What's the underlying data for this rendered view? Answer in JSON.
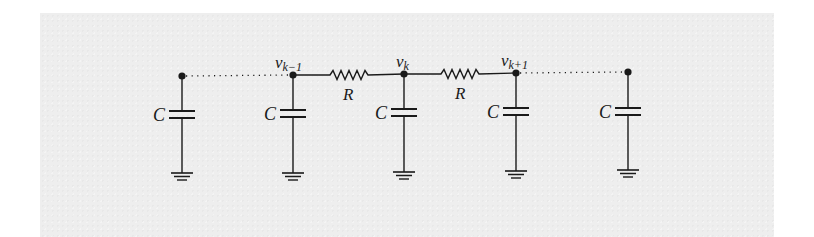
{
  "diagram": {
    "type": "RC ladder (discretized transmission line)",
    "colors": {
      "ink": "#1a1a1a",
      "paper": "#eeeeee",
      "background": "#ffffff"
    },
    "nodes": [
      {
        "id": "left-end",
        "label": "",
        "x": 182,
        "y": 76
      },
      {
        "id": "v_k_minus_1",
        "label_main": "v",
        "label_sub": "k−1",
        "x": 293,
        "y": 75
      },
      {
        "id": "v_k",
        "label_main": "v",
        "label_sub": "k",
        "x": 404,
        "y": 74
      },
      {
        "id": "v_k_plus_1",
        "label_main": "v",
        "label_sub": "k+1",
        "x": 516,
        "y": 73
      },
      {
        "id": "right-end",
        "label": "",
        "x": 628,
        "y": 72
      }
    ],
    "resistors": [
      {
        "label": "R",
        "from": "v_k_minus_1",
        "to": "v_k"
      },
      {
        "label": "R",
        "from": "v_k",
        "to": "v_k_plus_1"
      }
    ],
    "capacitors": [
      {
        "label": "C",
        "node": "left-end"
      },
      {
        "label": "C",
        "node": "v_k_minus_1"
      },
      {
        "label": "C",
        "node": "v_k"
      },
      {
        "label": "C",
        "node": "v_k_plus_1"
      },
      {
        "label": "C",
        "node": "right-end"
      }
    ],
    "dotted_links": [
      {
        "from": "left-end",
        "to": "v_k_minus_1"
      },
      {
        "from": "v_k_plus_1",
        "to": "right-end"
      }
    ]
  }
}
